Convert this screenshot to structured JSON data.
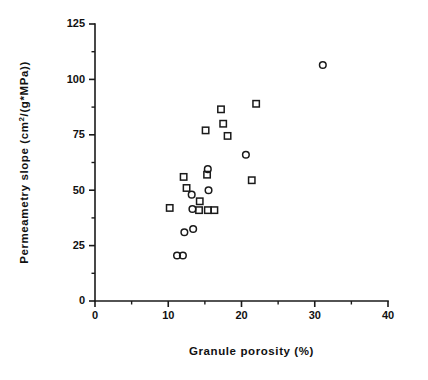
{
  "chart_data": {
    "type": "scatter",
    "title": "",
    "xlabel": "Granule porosity (%)",
    "ylabel": "Permeametry slope  (cm2/(g*MPa))",
    "ylabel_parts": {
      "prefix": "Permeametry  slope  (cm",
      "superscript": "2",
      "suffix": "/(g*MPa))"
    },
    "xlim": [
      0,
      40
    ],
    "ylim": [
      0,
      125
    ],
    "xticks": [
      0,
      10,
      20,
      30,
      40
    ],
    "xtick_labels": [
      "0",
      "10",
      "20",
      "30",
      "40"
    ],
    "yticks": [
      0,
      25,
      50,
      75,
      100,
      125
    ],
    "ytick_labels": [
      "0",
      "25",
      "50",
      "75",
      "100",
      "125"
    ],
    "x_minor_ticks": [
      5,
      15,
      25,
      35
    ],
    "y_minor_ticks": [
      12.5,
      37.5,
      62.5,
      87.5,
      112.5
    ],
    "grid": false,
    "legend": "none",
    "series": [
      {
        "name": "circles",
        "marker": "circle",
        "points": [
          {
            "x": 11.2,
            "y": 20.5
          },
          {
            "x": 12.0,
            "y": 20.5
          },
          {
            "x": 12.2,
            "y": 31.0
          },
          {
            "x": 13.4,
            "y": 32.5
          },
          {
            "x": 13.3,
            "y": 41.5
          },
          {
            "x": 13.2,
            "y": 48.0
          },
          {
            "x": 15.5,
            "y": 50.0
          },
          {
            "x": 15.4,
            "y": 59.5
          },
          {
            "x": 20.6,
            "y": 66.0
          },
          {
            "x": 31.1,
            "y": 106.5
          }
        ]
      },
      {
        "name": "squares",
        "marker": "square",
        "points": [
          {
            "x": 10.2,
            "y": 42.0
          },
          {
            "x": 12.1,
            "y": 56.0
          },
          {
            "x": 12.5,
            "y": 51.0
          },
          {
            "x": 14.3,
            "y": 45.0
          },
          {
            "x": 14.2,
            "y": 41.0
          },
          {
            "x": 15.3,
            "y": 57.0
          },
          {
            "x": 15.4,
            "y": 41.0
          },
          {
            "x": 16.3,
            "y": 41.0
          },
          {
            "x": 15.1,
            "y": 77.0
          },
          {
            "x": 17.2,
            "y": 86.5
          },
          {
            "x": 17.5,
            "y": 80.0
          },
          {
            "x": 18.1,
            "y": 74.5
          },
          {
            "x": 21.4,
            "y": 54.5
          },
          {
            "x": 22.0,
            "y": 89.0
          }
        ]
      }
    ]
  },
  "axes_geometry": {
    "left_px": 95,
    "bottom_px": 301,
    "right_px": 388,
    "top_px": 24
  },
  "colors": {
    "ink": "#1a1a1a",
    "background": "#ffffff"
  }
}
